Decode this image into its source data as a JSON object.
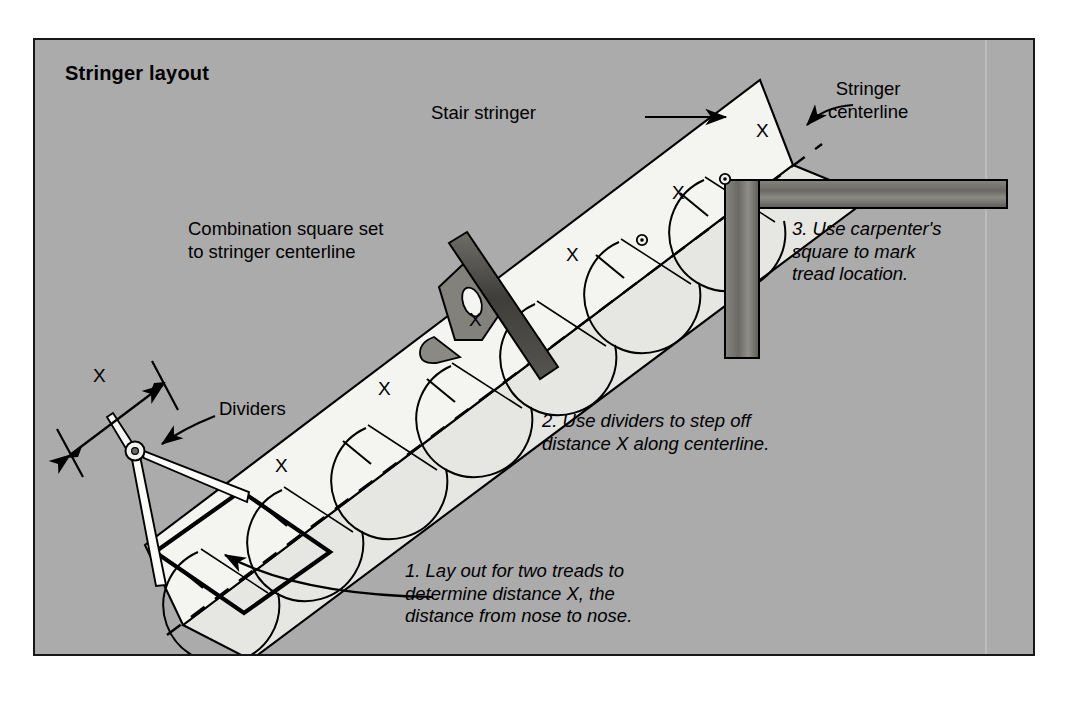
{
  "page": {
    "background": "#ffffff",
    "panel_background": "#ababab",
    "panel_border": "#17171a"
  },
  "title": "Stringer layout",
  "labels": {
    "stair_stringer": "Stair stringer",
    "stringer_centerline": "Stringer\ncenterline",
    "combination_square": "Combination square set\nto stringer centerline",
    "dividers": "Dividers",
    "dimension_x": "X"
  },
  "steps": [
    {
      "id": "step-1",
      "text": "1. Lay out for two treads to\ndetermine distance X, the\ndistance from nose to nose."
    },
    {
      "id": "step-2",
      "text": "2. Use dividers to step off\ndistance X along centerline."
    },
    {
      "id": "step-3",
      "text": "3. Use carpenter's\nsquare to mark\ntread location."
    }
  ],
  "x_marks": [
    {
      "id": "x-1",
      "label": "X"
    },
    {
      "id": "x-2",
      "label": "X"
    },
    {
      "id": "x-3",
      "label": "X"
    },
    {
      "id": "x-4",
      "label": "X"
    },
    {
      "id": "x-5",
      "label": "X"
    },
    {
      "id": "x-6",
      "label": "X"
    }
  ],
  "colors": {
    "stringer_face": "#f2f2ef",
    "stringer_shadow": "#e3e3df",
    "tool_dark": "#4c4a47",
    "tool_mid": "#6e6c68",
    "tool_light": "#9b9995",
    "line": "#000000"
  }
}
